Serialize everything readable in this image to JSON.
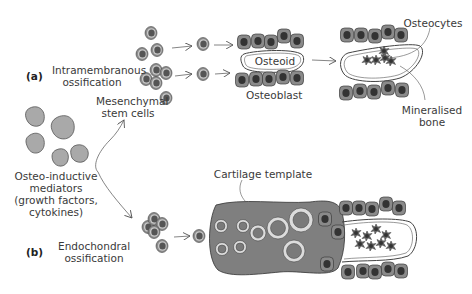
{
  "figure": {
    "panels": [
      {
        "id": "a",
        "label": "(a)",
        "title_line1": "Intramembranous",
        "title_line2": "ossification"
      },
      {
        "id": "b",
        "label": "(b)",
        "title_line1": "Endochondral",
        "title_line2": "ossification"
      }
    ],
    "labels": {
      "mesenchymal_line1": "Mesenchymal",
      "mesenchymal_line2": "stem cells",
      "osteoid": "Osteoid",
      "osteoblast": "Osteoblast",
      "osteocytes": "Osteocytes",
      "mineralised_line1": "Mineralised",
      "mineralised_line2": "bone",
      "cartilage_template": "Cartilage template",
      "mediators_line1": "Osteo-inductive",
      "mediators_line2": "mediators",
      "mediators_line3": "(growth factors,",
      "mediators_line4": "cytokines)"
    },
    "colors": {
      "background": "#ffffff",
      "cell_outer": "#8c8c8c",
      "cell_ring": "#c8c8c8",
      "cell_nucleus": "#555555",
      "mediator": "#a9a9a9",
      "cartilage": "#7f7f7f",
      "lacuna_ring": "#dcdcdc",
      "text": "#3a3a3a"
    }
  }
}
